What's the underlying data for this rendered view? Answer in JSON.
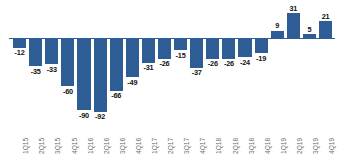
{
  "chart_data": {
    "type": "bar",
    "title": "",
    "subtitle": "",
    "xlabel": "",
    "ylabel": "",
    "grid": false,
    "legend": false,
    "categories": [
      "1Q15",
      "2Q15",
      "3Q15",
      "4Q15",
      "1Q16",
      "2Q16",
      "3Q16",
      "4Q16",
      "1Q17",
      "2Q17",
      "3Q17",
      "4Q17",
      "1Q18",
      "2Q18",
      "3Q18",
      "4Q18",
      "1Q19",
      "2Q19",
      "3Q19",
      "4Q19"
    ],
    "values": [
      -12,
      -35,
      -33,
      -60,
      -90,
      -92,
      -66,
      -49,
      -31,
      -26,
      -15,
      -37,
      -26,
      -26,
      -24,
      -19,
      9,
      31,
      5,
      21
    ],
    "data_labels": [
      "-12",
      "-35",
      "-33",
      "-60",
      "-90",
      "-92",
      "-66",
      "-49",
      "-31",
      "-26",
      "-15",
      "-37",
      "-26",
      "-26",
      "-24",
      "-19",
      "9",
      "31",
      "5",
      "21"
    ],
    "ylim": [
      -100,
      36
    ],
    "series_color": "#2e5c94",
    "label_color": "#111111",
    "tick_color": "#6b6b6b",
    "axis_color": "#2e5c94"
  }
}
